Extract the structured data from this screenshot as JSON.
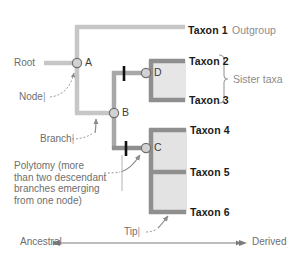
{
  "diagram": {
    "type": "phylogenetic-tree-anatomy",
    "colors": {
      "branch_light": "#c6c6c6",
      "branch_dark": "#8f8f8f",
      "clade_fill": "#e3e3e3",
      "node_fill": "#cfcfcf",
      "node_stroke": "#7a7a7a",
      "text_dark": "#1a1a1a",
      "text_gray": "#8c8c8c",
      "callout_gray": "#6e6e6e",
      "background": "#ffffff"
    },
    "taxa": [
      {
        "id": "taxon-1",
        "name": "Taxon 1",
        "note": "Outgroup",
        "tip_y": 27
      },
      {
        "id": "taxon-2",
        "name": "Taxon 2",
        "note": "",
        "tip_y": 62
      },
      {
        "id": "taxon-3",
        "name": "Taxon 3",
        "note": "",
        "tip_y": 100
      },
      {
        "id": "taxon-4",
        "name": "Taxon 4",
        "note": "",
        "tip_y": 131
      },
      {
        "id": "taxon-5",
        "name": "Taxon 5",
        "note": "",
        "tip_y": 172
      },
      {
        "id": "taxon-6",
        "name": "Taxon 6",
        "note": "",
        "tip_y": 212
      }
    ],
    "nodes": [
      {
        "id": "node-a",
        "label": "A",
        "x": 77,
        "y": 63
      },
      {
        "id": "node-b",
        "label": "B",
        "x": 114,
        "y": 113
      },
      {
        "id": "node-c",
        "label": "C",
        "x": 146,
        "y": 148
      },
      {
        "id": "node-d",
        "label": "D",
        "x": 146,
        "y": 73
      }
    ],
    "callouts": {
      "root": "Root",
      "node": "Node",
      "branch": "Branch",
      "tip": "Tip",
      "polytomy_lines": [
        "Polytomy (more",
        "than two descendant",
        "branches emerging",
        "from one node)"
      ]
    },
    "brackets": [
      {
        "id": "sister-taxa",
        "label": "Sister taxa",
        "groups": [
          "Taxon 2",
          "Taxon 3"
        ]
      }
    ],
    "axis": {
      "left_label": "Ancestral",
      "right_label": "Derived",
      "double_headed": true
    },
    "tick_glyph": "|"
  }
}
